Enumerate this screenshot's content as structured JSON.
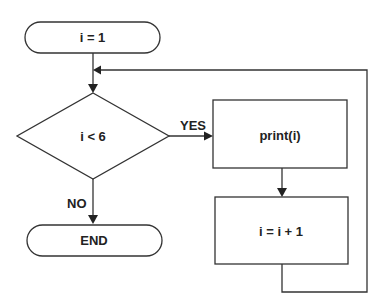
{
  "diagram": {
    "type": "flowchart",
    "nodes": [
      {
        "id": "start",
        "shape": "terminator",
        "label": "i = 1"
      },
      {
        "id": "cond",
        "shape": "decision",
        "label": "i < 6"
      },
      {
        "id": "print",
        "shape": "process",
        "label": "print(i)"
      },
      {
        "id": "incr",
        "shape": "process",
        "label": "i = i + 1"
      },
      {
        "id": "end",
        "shape": "terminator",
        "label": "END"
      }
    ],
    "edges": [
      {
        "from": "start",
        "to": "cond",
        "label": ""
      },
      {
        "from": "cond",
        "to": "print",
        "label": "YES"
      },
      {
        "from": "cond",
        "to": "end",
        "label": "NO"
      },
      {
        "from": "print",
        "to": "incr",
        "label": ""
      },
      {
        "from": "incr",
        "to": "cond",
        "label": ""
      }
    ],
    "edge_labels": {
      "yes": "YES",
      "no": "NO"
    },
    "colors": {
      "stroke": "#333333",
      "text": "#222222",
      "background": "#ffffff"
    }
  }
}
